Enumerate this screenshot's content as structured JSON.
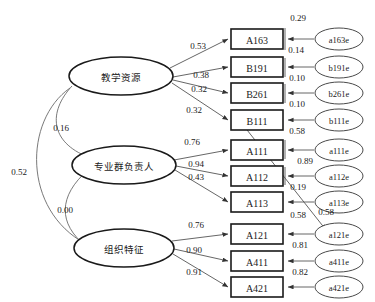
{
  "diagram": {
    "latents": [
      {
        "id": "teaching-resources",
        "label": "教学资源",
        "cx": 121,
        "cy": 76,
        "rx": 52,
        "ry": 19
      },
      {
        "id": "program-leader",
        "label": "专业群负责人",
        "cx": 124,
        "cy": 165,
        "rx": 52,
        "ry": 19
      },
      {
        "id": "organizational-traits",
        "label": "组织特征",
        "cx": 124,
        "cy": 248,
        "rx": 50,
        "ry": 19
      }
    ],
    "observed": [
      {
        "id": "A163",
        "label": "A163",
        "x": 231,
        "y": 29,
        "w": 52,
        "h": 20
      },
      {
        "id": "B191",
        "label": "B191",
        "x": 231,
        "y": 57,
        "w": 52,
        "h": 20
      },
      {
        "id": "B261",
        "label": "B261",
        "x": 231,
        "y": 83,
        "w": 52,
        "h": 20
      },
      {
        "id": "B111",
        "label": "B111",
        "x": 231,
        "y": 110,
        "w": 52,
        "h": 20
      },
      {
        "id": "A111",
        "label": "A111",
        "x": 231,
        "y": 140,
        "w": 52,
        "h": 20
      },
      {
        "id": "A112",
        "label": "A112",
        "x": 231,
        "y": 166,
        "w": 52,
        "h": 20
      },
      {
        "id": "A113",
        "label": "A113",
        "x": 231,
        "y": 192,
        "w": 52,
        "h": 20
      },
      {
        "id": "A121",
        "label": "A121",
        "x": 231,
        "y": 224,
        "w": 52,
        "h": 20
      },
      {
        "id": "A411",
        "label": "A411",
        "x": 231,
        "y": 251,
        "w": 52,
        "h": 20
      },
      {
        "id": "A421",
        "label": "A421",
        "x": 231,
        "y": 277,
        "w": 52,
        "h": 20
      }
    ],
    "errors": [
      {
        "id": "a163e",
        "label": "a163e",
        "cx": 339,
        "cy": 39,
        "rx": 24,
        "ry": 11
      },
      {
        "id": "b191e",
        "label": "b191e",
        "cx": 339,
        "cy": 67,
        "rx": 24,
        "ry": 11
      },
      {
        "id": "b261e",
        "label": "b261e",
        "cx": 339,
        "cy": 93,
        "rx": 24,
        "ry": 11
      },
      {
        "id": "b111e",
        "label": "b111e",
        "cx": 339,
        "cy": 120,
        "rx": 24,
        "ry": 11
      },
      {
        "id": "a111e",
        "label": "a111e",
        "cx": 339,
        "cy": 150,
        "rx": 24,
        "ry": 11
      },
      {
        "id": "a112e",
        "label": "a112e",
        "cx": 339,
        "cy": 176,
        "rx": 24,
        "ry": 11
      },
      {
        "id": "a113e",
        "label": "a113e",
        "cx": 339,
        "cy": 202,
        "rx": 24,
        "ry": 11
      },
      {
        "id": "a121e",
        "label": "a121e",
        "cx": 339,
        "cy": 234,
        "rx": 24,
        "ry": 11
      },
      {
        "id": "a411e",
        "label": "a411e",
        "cx": 339,
        "cy": 261,
        "rx": 24,
        "ry": 11
      },
      {
        "id": "a421e",
        "label": "a421e",
        "cx": 339,
        "cy": 287,
        "rx": 24,
        "ry": 11
      }
    ],
    "loadings": [
      {
        "id": "load-teaching-A163",
        "from": "teaching-resources",
        "to": "A163",
        "value": "0.53",
        "lx": 198,
        "ly": 46
      },
      {
        "id": "load-teaching-B191",
        "from": "teaching-resources",
        "to": "B191",
        "value": "0.38",
        "lx": 201,
        "ly": 75
      },
      {
        "id": "load-teaching-B261",
        "from": "teaching-resources",
        "to": "B261",
        "value": "0.32",
        "lx": 199,
        "ly": 89
      },
      {
        "id": "load-teaching-B111",
        "from": "teaching-resources",
        "to": "B111",
        "value": "0.32",
        "lx": 194,
        "ly": 110
      },
      {
        "id": "load-leader-A111",
        "from": "program-leader",
        "to": "A111",
        "value": "0.76",
        "lx": 192,
        "ly": 142
      },
      {
        "id": "load-leader-A112",
        "from": "program-leader",
        "to": "A112",
        "value": "0.94",
        "lx": 196,
        "ly": 164
      },
      {
        "id": "load-leader-A113",
        "from": "program-leader",
        "to": "A113",
        "value": "0.43",
        "lx": 196,
        "ly": 177
      },
      {
        "id": "load-org-A121",
        "from": "organizational-traits",
        "to": "A121",
        "value": "0.76",
        "lx": 196,
        "ly": 225
      },
      {
        "id": "load-org-A411",
        "from": "organizational-traits",
        "to": "A411",
        "value": "0.90",
        "lx": 194,
        "ly": 250
      },
      {
        "id": "load-org-A421",
        "from": "organizational-traits",
        "to": "A421",
        "value": "0.91",
        "lx": 194,
        "ly": 272
      }
    ],
    "error_values": [
      {
        "id": "err-A163-top",
        "value": "0.29",
        "lx": 298,
        "ly": 18
      },
      {
        "id": "err-A163",
        "value": "0.14",
        "lx": 296,
        "ly": 50
      },
      {
        "id": "err-B191",
        "value": "0.10",
        "lx": 297,
        "ly": 78
      },
      {
        "id": "err-B261",
        "value": "0.10",
        "lx": 297,
        "ly": 104
      },
      {
        "id": "err-B111",
        "value": "0.58",
        "lx": 297,
        "ly": 131
      },
      {
        "id": "err-A111",
        "value": "0.89",
        "lx": 305,
        "ly": 161
      },
      {
        "id": "err-A112",
        "value": "0.19",
        "lx": 298,
        "ly": 187
      },
      {
        "id": "err-A113",
        "value": "0.58",
        "lx": 298,
        "ly": 215
      },
      {
        "id": "cov-a113e-a121e",
        "value": "0.58",
        "lx": 326,
        "ly": 212
      },
      {
        "id": "err-A121",
        "value": "0.81",
        "lx": 300,
        "ly": 245
      },
      {
        "id": "err-A411",
        "value": "0.82",
        "lx": 300,
        "ly": 272
      }
    ],
    "covariances": [
      {
        "id": "cov-teaching-leader",
        "between": [
          "teaching-resources",
          "program-leader"
        ],
        "value": "0.16",
        "lx": 61,
        "ly": 128
      },
      {
        "id": "cov-teaching-org",
        "between": [
          "teaching-resources",
          "organizational-traits"
        ],
        "value": "0.52",
        "lx": 19,
        "ly": 172
      },
      {
        "id": "cov-leader-org",
        "between": [
          "program-leader",
          "organizational-traits"
        ],
        "value": "0.00",
        "lx": 65,
        "ly": 210
      }
    ]
  }
}
